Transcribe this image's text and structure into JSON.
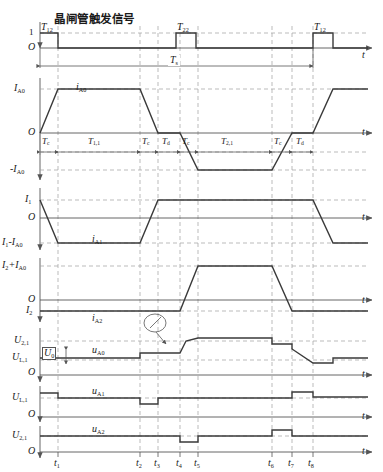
{
  "figure": {
    "title": "晶闸管触发信号",
    "type": "timing-waveform-diagram",
    "axis_label_time": "t",
    "origin_label": "O"
  },
  "colors": {
    "waveform": "#3a3a3a",
    "axis": "#555555",
    "dashed_guide": "#9a9a9a",
    "text": "#1a1a1a",
    "background": "#ffffff"
  },
  "time_markers": {
    "label_prefix": "t",
    "items": [
      {
        "id": "t1",
        "label": "t",
        "sub": "1",
        "x": 58
      },
      {
        "id": "t2",
        "label": "t",
        "sub": "2",
        "x": 140
      },
      {
        "id": "t3",
        "label": "t",
        "sub": "3",
        "x": 158
      },
      {
        "id": "t4",
        "label": "t",
        "sub": "4",
        "x": 180
      },
      {
        "id": "t5",
        "label": "t",
        "sub": "5",
        "x": 198
      },
      {
        "id": "t6",
        "label": "t",
        "sub": "6",
        "x": 272
      },
      {
        "id": "t7",
        "label": "t",
        "sub": "7",
        "x": 292
      },
      {
        "id": "t8",
        "label": "t",
        "sub": "8",
        "x": 312
      }
    ]
  },
  "panels": [
    {
      "id": "trigger",
      "name": "thyristor-trigger-signal",
      "title": "晶闸管触发信号",
      "y_labels": [
        {
          "text": "1",
          "sub": ""
        },
        {
          "text": "O",
          "sub": ""
        }
      ],
      "pulses": [
        {
          "label": "T",
          "sub": "12",
          "x_start": 40,
          "x_end": 58
        },
        {
          "label": "T",
          "sub": "22",
          "x_start": 176,
          "x_end": 196
        },
        {
          "label": "T",
          "sub": "12",
          "x_start": 313,
          "x_end": 333
        }
      ],
      "span": {
        "label": "T",
        "sub": "s",
        "from": 40,
        "to": 313
      }
    },
    {
      "id": "ia0",
      "name": "current-ia0",
      "signal": {
        "label": "i",
        "sub": "A0"
      },
      "y_labels": [
        {
          "text": "I",
          "sub": "A0"
        },
        {
          "text": "O",
          "sub": ""
        },
        {
          "text": "-I",
          "sub": "A0"
        }
      ],
      "intervals": [
        {
          "label": "T",
          "sub": "c",
          "from": 40,
          "to": 58
        },
        {
          "label": "T",
          "sub": "1,1",
          "from": 58,
          "to": 140
        },
        {
          "label": "T",
          "sub": "c",
          "from": 140,
          "to": 158
        },
        {
          "label": "T",
          "sub": "d",
          "from": 158,
          "to": 180
        },
        {
          "label": "T",
          "sub": "c",
          "from": 180,
          "to": 198
        },
        {
          "label": "T",
          "sub": "2,1",
          "from": 198,
          "to": 272
        },
        {
          "label": "T",
          "sub": "c",
          "from": 272,
          "to": 292
        },
        {
          "label": "T",
          "sub": "d",
          "from": 292,
          "to": 313
        }
      ]
    },
    {
      "id": "ia1",
      "name": "current-ia1",
      "signal": {
        "label": "i",
        "sub": "A1"
      },
      "y_labels": [
        {
          "text": "I",
          "sub": "1"
        },
        {
          "text": "O",
          "sub": ""
        },
        {
          "text": "I",
          "sub": "1",
          "suffix": "-I",
          "suffix_sub": "A0"
        }
      ]
    },
    {
      "id": "ia2",
      "name": "current-ia2",
      "signal": {
        "label": "i",
        "sub": "A2"
      },
      "y_labels": [
        {
          "text": "I",
          "sub": "2",
          "suffix": "+I",
          "suffix_sub": "A0"
        },
        {
          "text": "O",
          "sub": ""
        },
        {
          "text": "I",
          "sub": "2"
        }
      ]
    },
    {
      "id": "ua0",
      "name": "voltage-ua0",
      "signal": {
        "label": "u",
        "sub": "A0"
      },
      "y_labels": [
        {
          "text": "U",
          "sub": "2,1"
        },
        {
          "text": "U",
          "sub": "L,1"
        },
        {
          "text": "O",
          "sub": ""
        }
      ],
      "annotations": [
        {
          "id": "u0",
          "label": "U",
          "sub": "0",
          "type": "boxed-callout"
        },
        {
          "id": "detail",
          "label": "",
          "type": "circled-detail-marker"
        }
      ]
    },
    {
      "id": "ua1",
      "name": "voltage-ua1",
      "signal": {
        "label": "u",
        "sub": "A1"
      },
      "y_labels": [
        {
          "text": "U",
          "sub": "L,1"
        },
        {
          "text": "O",
          "sub": ""
        }
      ]
    },
    {
      "id": "ua2",
      "name": "voltage-ua2",
      "signal": {
        "label": "u",
        "sub": "A2"
      },
      "y_labels": [
        {
          "text": "U",
          "sub": "2,1"
        },
        {
          "text": "O",
          "sub": ""
        }
      ]
    }
  ]
}
